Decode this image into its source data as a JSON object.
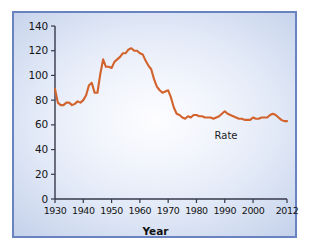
{
  "chart_data": {
    "type": "line",
    "title": "",
    "xlabel": "Year",
    "ylabel": "",
    "xlim": [
      1930,
      2012
    ],
    "ylim": [
      0,
      140
    ],
    "grid": false,
    "legend_position": "inline-annotation",
    "series_label": "Rate",
    "line_color": "#d2632c",
    "annotations": [
      {
        "text": "Rate",
        "x": 1991,
        "y": 50
      }
    ],
    "x_ticks": [
      1930,
      1940,
      1950,
      1960,
      1970,
      1980,
      1990,
      2000,
      2012
    ],
    "y_ticks": [
      0,
      20,
      40,
      60,
      80,
      100,
      120,
      140
    ],
    "x": [
      1930,
      1931,
      1932,
      1933,
      1934,
      1935,
      1936,
      1937,
      1938,
      1939,
      1940,
      1941,
      1942,
      1943,
      1944,
      1945,
      1946,
      1947,
      1948,
      1949,
      1950,
      1951,
      1952,
      1953,
      1954,
      1955,
      1956,
      1957,
      1958,
      1959,
      1960,
      1961,
      1962,
      1963,
      1964,
      1965,
      1966,
      1967,
      1968,
      1969,
      1970,
      1971,
      1972,
      1973,
      1974,
      1975,
      1976,
      1977,
      1978,
      1979,
      1980,
      1981,
      1982,
      1983,
      1984,
      1985,
      1986,
      1987,
      1988,
      1989,
      1990,
      1991,
      1992,
      1993,
      1994,
      1995,
      1996,
      1997,
      1998,
      1999,
      2000,
      2001,
      2002,
      2003,
      2004,
      2005,
      2006,
      2007,
      2008,
      2009,
      2010,
      2011,
      2012
    ],
    "values": [
      89,
      78,
      76,
      76,
      78,
      78,
      76,
      77,
      79,
      78,
      80,
      84,
      92,
      94,
      86,
      86,
      101,
      113,
      107,
      107,
      106,
      111,
      113,
      115,
      118,
      118,
      121,
      122,
      120,
      120,
      118,
      117,
      112,
      108,
      105,
      97,
      91,
      88,
      86,
      87,
      88,
      82,
      74,
      69,
      68,
      66,
      65,
      67,
      66,
      68,
      68,
      67,
      67,
      66,
      66,
      66,
      65,
      66,
      67,
      69,
      71,
      69,
      68,
      67,
      66,
      65,
      65,
      64,
      64,
      64,
      66,
      65,
      65,
      66,
      66,
      66,
      68,
      69,
      68,
      66,
      64,
      63,
      63
    ]
  },
  "axis_labels": {
    "y": [
      "140",
      "120",
      "100",
      "80",
      "60",
      "40",
      "20",
      "0"
    ],
    "x": [
      "1930",
      "1940",
      "1950",
      "1960",
      "1970",
      "1980",
      "1990",
      "2000",
      "2012"
    ],
    "x_title": "Year"
  }
}
